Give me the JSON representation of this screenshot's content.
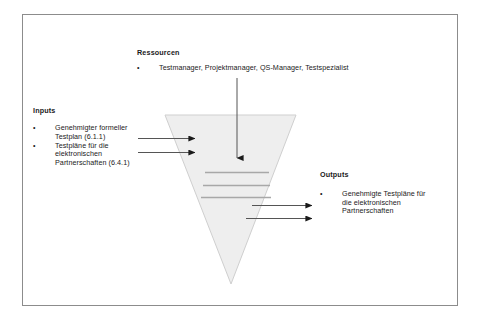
{
  "diagram": {
    "shape": {
      "name": "inverted-triangle",
      "fill": "#eeeeee",
      "stroke": "#cccccc"
    },
    "resources": {
      "heading": "Ressourcen",
      "bullet_mark": "•",
      "items": [
        "Testmanager, Projektmanager, QS-Manager, Testspezialist"
      ]
    },
    "inputs": {
      "heading": "Inputs",
      "bullet_mark": "•",
      "items": [
        "Genehmigter formeller Testplan (6.1.1)",
        "Testpläne für die elektronischen Partnerschaften (6.4.1)"
      ]
    },
    "outputs": {
      "heading": "Outputs",
      "bullet_mark": "•",
      "items": [
        "Genehmigte Testpläne für die elektronischen Partnerschaften"
      ]
    },
    "connectors": {
      "input_arrows": 2,
      "output_arrows": 2,
      "resource_arrows": 1,
      "internal_bars": 3,
      "stroke": "#555555"
    }
  }
}
